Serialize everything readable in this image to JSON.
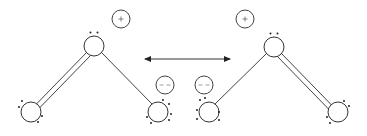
{
  "diagram": {
    "title": "Resonance structures",
    "arrow": {
      "type": "double-headed",
      "meaning": "resonance"
    },
    "structures": [
      {
        "name": "left-structure",
        "atoms": [
          {
            "id": "top",
            "lone_pairs_shown": "two dots above"
          },
          {
            "id": "bottom-left",
            "lone_pairs_shown": "four dots"
          },
          {
            "id": "bottom-right",
            "lone_pairs_shown": "six dots"
          }
        ],
        "bonds": [
          {
            "from": "top",
            "to": "bottom-left",
            "order": "double"
          },
          {
            "from": "top",
            "to": "bottom-right",
            "order": "single"
          }
        ],
        "charges": [
          {
            "sign": "+",
            "near": "top"
          },
          {
            "sign": "−",
            "near": "bottom-right"
          }
        ]
      },
      {
        "name": "right-structure",
        "atoms": [
          {
            "id": "top",
            "lone_pairs_shown": "two dots above"
          },
          {
            "id": "bottom-left",
            "lone_pairs_shown": "six dots"
          },
          {
            "id": "bottom-right",
            "lone_pairs_shown": "four dots"
          }
        ],
        "bonds": [
          {
            "from": "top",
            "to": "bottom-left",
            "order": "single"
          },
          {
            "from": "top",
            "to": "bottom-right",
            "order": "double"
          }
        ],
        "charges": [
          {
            "sign": "+",
            "near": "top"
          },
          {
            "sign": "−",
            "near": "bottom-left"
          }
        ]
      }
    ],
    "colors": {
      "stroke": "#333333",
      "background": "#ffffff"
    }
  }
}
